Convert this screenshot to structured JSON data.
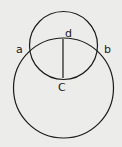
{
  "diagram": {
    "background": "#ececea",
    "stroke": "#1a1a1a",
    "small_circle": {
      "cx": 63.5,
      "cy": 45.5,
      "r": 34
    },
    "large_circle": {
      "cx": 63.5,
      "cy": 88,
      "r": 50
    },
    "segment": {
      "x1": 63,
      "y1": 39,
      "x2": 63,
      "y2": 78
    },
    "labels": {
      "a": "a",
      "b": "b",
      "c": "C",
      "d": "d"
    }
  }
}
